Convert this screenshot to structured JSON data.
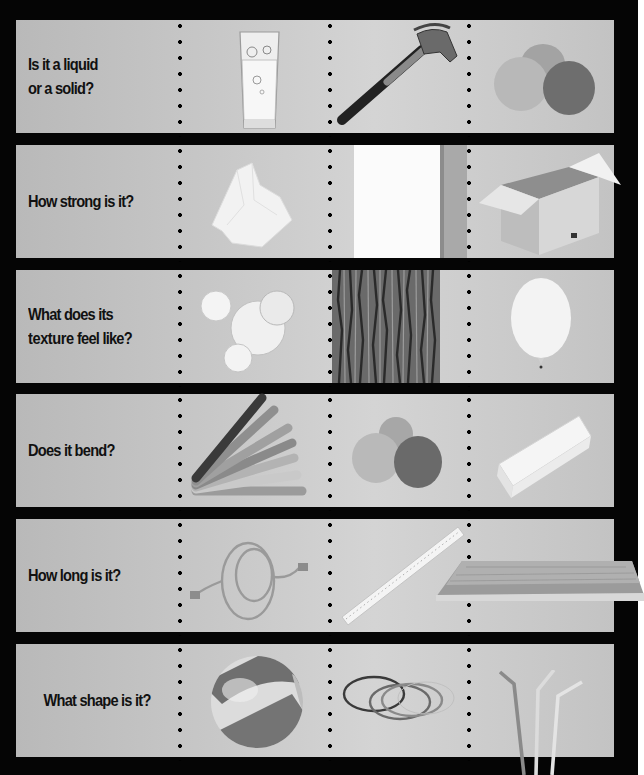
{
  "worksheet": {
    "header_text_cutoff": "",
    "rows": [
      {
        "question_line1": "Is it a liquid",
        "question_line2": "or a solid?",
        "items": [
          "glass-of-water",
          "hammer",
          "play-dough-balls"
        ]
      },
      {
        "question": "How strong is it?",
        "items": [
          "tissue-paper",
          "sheet-of-paper",
          "cardboard-box"
        ]
      },
      {
        "question_line1": "What does its",
        "question_line2_bold": "texture",
        "question_line2_rest": " feel like?",
        "items": [
          "soap-bubbles",
          "tree-bark",
          "balloon"
        ]
      },
      {
        "question": "Does it bend?",
        "items": [
          "craft-sticks",
          "play-dough-balls",
          "eraser"
        ]
      },
      {
        "question": "How long is it?",
        "items": [
          "rope",
          "ruler",
          "wooden-plank"
        ]
      },
      {
        "question": "What shape is it?",
        "items": [
          "beach-ball",
          "rubber-bands",
          "drinking-straws"
        ]
      }
    ]
  },
  "colors": {
    "background": "#050505",
    "panel": "#c6c6c6",
    "text": "#111111",
    "page_margin": "#ffffff"
  }
}
